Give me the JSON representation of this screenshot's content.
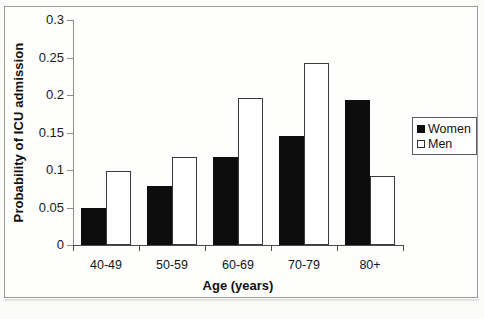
{
  "chart_data": {
    "type": "bar",
    "title": "",
    "subtitle": "",
    "xlabel": "Age (years)",
    "ylabel": "Probability of ICU admission",
    "categories": [
      "40-49",
      "50-59",
      "60-69",
      "70-79",
      "80+"
    ],
    "series": [
      {
        "name": "Women",
        "color": "#0d0d0d",
        "fill": "solid",
        "values": [
          0.049,
          0.079,
          0.117,
          0.146,
          0.193
        ]
      },
      {
        "name": "Men",
        "color": "#ffffff",
        "fill": "hollow",
        "values": [
          0.099,
          0.117,
          0.196,
          0.243,
          0.092
        ]
      }
    ],
    "ylim": [
      0,
      0.3
    ],
    "ytick_labels": [
      "0",
      "0.05",
      "0.1",
      "0.15",
      "0.2",
      "0.25",
      "0.3"
    ],
    "ytick_values": [
      0,
      0.05,
      0.1,
      0.15,
      0.2,
      0.25,
      0.3
    ],
    "grid": false,
    "legend_position": "right"
  },
  "legend": {
    "entries": [
      {
        "label": "Women",
        "swatch": "filled-square"
      },
      {
        "label": "Men",
        "swatch": "hollow-square"
      }
    ]
  }
}
